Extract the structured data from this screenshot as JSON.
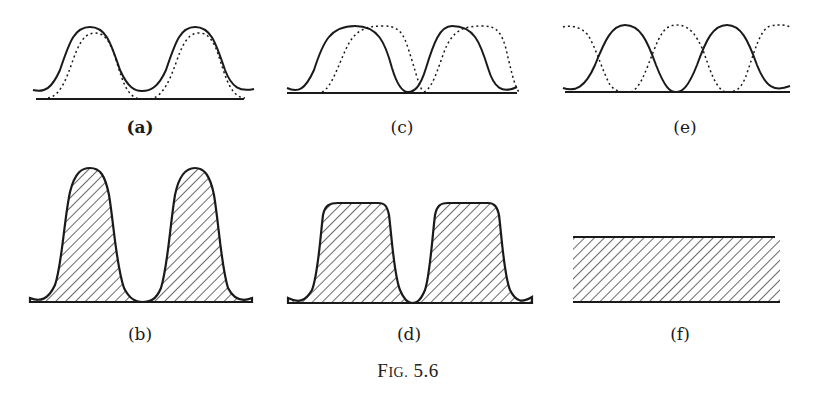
{
  "figure": {
    "caption_prefix": "F",
    "caption_smallcaps": "IG.",
    "caption_number": "5.6"
  },
  "panels": [
    {
      "id": "a",
      "label": "(a)",
      "description": "Two bell-shaped pulses (solid) with slightly narrower, right-shifted dotted pulses overlaid, above a baseline"
    },
    {
      "id": "b",
      "label": "(b)",
      "description": "Two tall hatched bell-shaped pulses"
    },
    {
      "id": "c",
      "label": "(c)",
      "description": "Two solid pulses with dotted copies shifted right by about half a pulse width"
    },
    {
      "id": "d",
      "label": "(d)",
      "description": "Two hatched flat-topped pulses"
    },
    {
      "id": "e",
      "label": "(e)",
      "description": "Solid pulses interleaved with dotted pulses shifted by half a period"
    },
    {
      "id": "f",
      "label": "(f)",
      "description": "Uniform hatched rectangular band"
    }
  ],
  "colors": {
    "ink": "#1a1a1a",
    "background": "#ffffff"
  }
}
